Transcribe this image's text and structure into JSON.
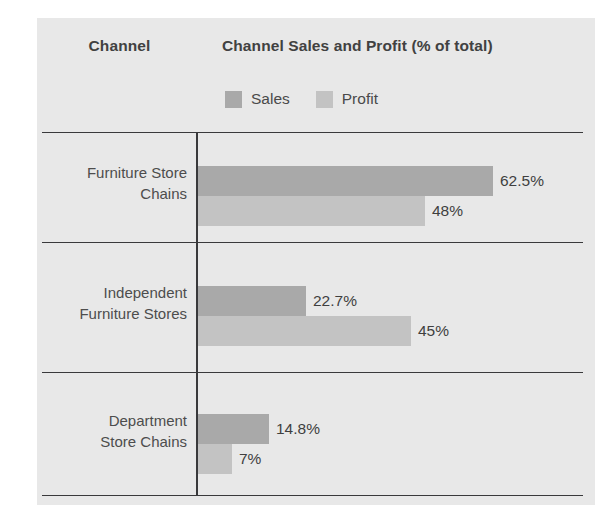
{
  "header": {
    "channel_label": "Channel",
    "chart_title": "Channel Sales and Profit (% of total)"
  },
  "legend": {
    "items": [
      {
        "name": "Sales",
        "color": "#a9a9a9",
        "icon": "legend-swatch-icon"
      },
      {
        "name": "Profit",
        "color": "#c3c3c3",
        "icon": "legend-swatch-icon"
      }
    ]
  },
  "colors": {
    "sales": "#a9a9a9",
    "profit": "#c3c3c3",
    "rule": "#39393b",
    "card_background": "#e8e8e8",
    "text": "#4d4d4d",
    "heading": "#414141"
  },
  "chart_data": {
    "type": "bar",
    "orientation": "horizontal",
    "title": "Channel Sales and Profit (% of total)",
    "xlabel": "",
    "ylabel": "Channel",
    "grid": false,
    "legend_position": "top",
    "categories": [
      "Furniture Store Chains",
      "Independent Furniture Stores",
      "Department Store Chains"
    ],
    "series": [
      {
        "name": "Sales",
        "values": [
          62.5,
          22.7,
          14.8
        ],
        "labels": [
          "62.5%",
          "22.7%",
          "14.8%"
        ]
      },
      {
        "name": "Profit",
        "values": [
          48,
          45,
          7
        ],
        "labels": [
          "48%",
          "45%",
          "7%"
        ]
      }
    ]
  },
  "groups": [
    {
      "category_line1": "Furniture Store",
      "category_line2": "Chains",
      "sales": {
        "label": "62.5%",
        "width": 295
      },
      "profit": {
        "label": "48%",
        "width": 227
      }
    },
    {
      "category_line1": "Independent",
      "category_line2": "Furniture Stores",
      "sales": {
        "label": "22.7%",
        "width": 108
      },
      "profit": {
        "label": "45%",
        "width": 213
      }
    },
    {
      "category_line1": "Department",
      "category_line2": "Store Chains",
      "sales": {
        "label": "14.8%",
        "width": 71
      },
      "profit": {
        "label": "7%",
        "width": 34
      }
    }
  ]
}
